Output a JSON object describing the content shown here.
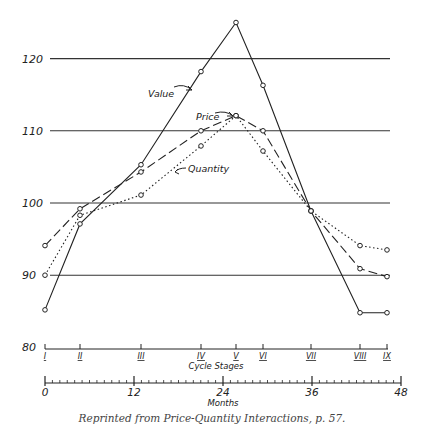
{
  "chart_data": {
    "type": "line",
    "title": "",
    "xlabel": "Cycle Stages",
    "x2label": "Months",
    "ylabel": "",
    "ylim": [
      80,
      125
    ],
    "yticks": [
      80,
      90,
      100,
      110,
      120
    ],
    "grid_y": [
      90,
      100,
      110,
      120
    ],
    "stages": [
      "I",
      "II",
      "III",
      "IV",
      "V",
      "VI",
      "VII",
      "VIII",
      "IX"
    ],
    "stage_months": [
      0,
      4.8,
      12,
      19.5,
      23.5,
      26.8,
      32.8,
      38.3,
      41.8
    ],
    "months_ticks": [
      0,
      12,
      24,
      36,
      48
    ],
    "months_range": [
      0,
      48
    ],
    "series": [
      {
        "name": "Value",
        "style": "solid",
        "values": [
          85.2,
          97.1,
          105.3,
          118.2,
          125.0,
          116.3,
          98.9,
          84.8,
          84.8
        ]
      },
      {
        "name": "Price",
        "style": "dashed",
        "values": [
          94.1,
          99.2,
          104.3,
          110.0,
          112.1,
          110.0,
          98.9,
          90.9,
          89.8
        ]
      },
      {
        "name": "Quantity",
        "style": "dotted",
        "values": [
          90.0,
          98.3,
          101.1,
          107.9,
          112.1,
          107.2,
          98.9,
          94.1,
          93.5
        ]
      }
    ],
    "annotations": [
      "Value",
      "Price",
      "Quantity"
    ]
  },
  "labels": {
    "y120": "120",
    "y110": "110",
    "y100": "100",
    "y90": "90",
    "y80": "80",
    "stage_axis_title": "Cycle Stages",
    "months_axis_title": "Months",
    "value_label": "Value",
    "price_label": "Price",
    "quantity_label": "Quantity"
  },
  "caption": "Reprinted from Price-Quantity Interactions, p. 57."
}
